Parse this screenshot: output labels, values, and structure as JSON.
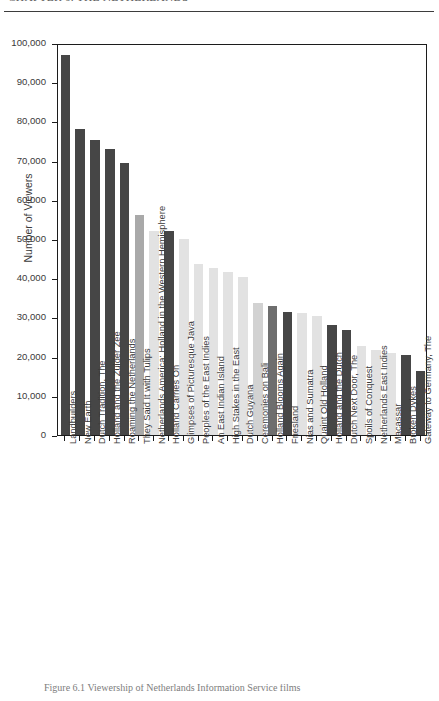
{
  "header": {
    "running_head": "CHAPTER 6. THE NETHERLANDS"
  },
  "caption": {
    "text": "Figure 6.1  Viewership of Netherlands Information Service films"
  },
  "chart_data": {
    "type": "bar",
    "title": "",
    "xlabel": "",
    "ylabel": "Number of Viewers",
    "ylim": [
      0,
      100000
    ],
    "ytick_values": [
      0,
      10000,
      20000,
      30000,
      40000,
      50000,
      60000,
      70000,
      80000,
      90000,
      100000
    ],
    "ytick_labels": [
      "0",
      "10,000",
      "20,000",
      "30,000",
      "40,000",
      "50,000",
      "60,000",
      "70,000",
      "80,000",
      "90,000",
      "100,000"
    ],
    "grid": false,
    "legend": "none",
    "categories": [
      "Landbuilders",
      "New Earth",
      "Dutch Tradition, The",
      "Holland and the Zuider Zee",
      "Roaming the Netherlands",
      "They Said It with Tulips",
      "Netherlands America: Holland in the Western Hemisphere",
      "Holland Carries On",
      "Glimpses of Picturesque Java",
      "Peoples of the East Indies",
      "An East Indian Island",
      "High Stakes in the East",
      "Dutch Guyana",
      "Ceremonies on Bali",
      "Holland Blooms Again",
      "Friesland",
      "Nias and Sumatra",
      "Quaint Old Holland",
      "Holland and the Dutch",
      "Dutch Next Door, The",
      "Spoils of Conquest",
      "Netherlands East Indies",
      "Macassar",
      "Broken Dykes",
      "Gateway to Germany, The"
    ],
    "values": [
      97000,
      78000,
      75200,
      73000,
      69500,
      56200,
      52000,
      52000,
      50000,
      43500,
      42500,
      41500,
      40300,
      33800,
      33000,
      31500,
      31200,
      30300,
      28000,
      26800,
      22800,
      21800,
      21000,
      20300,
      16300
    ],
    "bar_colors": [
      "#464646",
      "#464646",
      "#464646",
      "#464646",
      "#464646",
      "#a9a9a9",
      "#e2e2e2",
      "#464646",
      "#e2e2e2",
      "#e2e2e2",
      "#e2e2e2",
      "#e2e2e2",
      "#e2e2e2",
      "#d2d2d2",
      "#6e6e6e",
      "#464646",
      "#e2e2e2",
      "#e2e2e2",
      "#464646",
      "#464646",
      "#e2e2e2",
      "#e2e2e2",
      "#e2e2e2",
      "#464646",
      "#464646"
    ]
  }
}
